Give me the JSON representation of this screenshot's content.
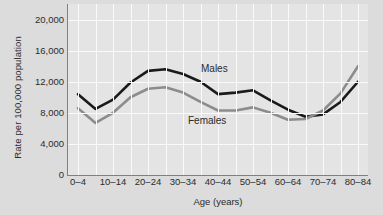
{
  "chart_data": {
    "type": "line",
    "title": "",
    "xlabel": "Age (years)",
    "ylabel": "Rate per 100,000 population",
    "xlim_categories": [
      "0–4",
      "5–9",
      "10–14",
      "15–19",
      "20–24",
      "25–29",
      "30–34",
      "35–39",
      "40–44",
      "45–49",
      "50–54",
      "55–59",
      "60–64",
      "65–69",
      "70–74",
      "75–79",
      "80–84"
    ],
    "categories": [
      "0–4",
      "5–9",
      "10–14",
      "15–19",
      "20–24",
      "25–29",
      "30–34",
      "35–39",
      "40–44",
      "45–49",
      "50–54",
      "55–59",
      "60–64",
      "65–69",
      "70–74",
      "75–79",
      "80–84"
    ],
    "xticklabels_shown": [
      "0–4",
      "10–14",
      "20–24",
      "30–34",
      "40–44",
      "50–54",
      "60–64",
      "70–74",
      "80–84"
    ],
    "yticklabels": [
      "0",
      "4,000",
      "8,000",
      "12,000",
      "16,000",
      "20,000"
    ],
    "ytickvalues": [
      0,
      4000,
      8000,
      12000,
      16000,
      20000
    ],
    "ylim": [
      0,
      22000
    ],
    "grid": true,
    "legend_position": "inline-annotations",
    "series": [
      {
        "name": "Males",
        "color": "#1a1a1a",
        "values": [
          10400,
          8500,
          9700,
          11900,
          13400,
          13600,
          13000,
          12000,
          10400,
          10600,
          10900,
          9600,
          8400,
          7500,
          7800,
          9400,
          12000
        ]
      },
      {
        "name": "Females",
        "color": "#8c8c8c",
        "values": [
          8600,
          6700,
          8000,
          10000,
          11100,
          11300,
          10600,
          9400,
          8300,
          8300,
          8700,
          8000,
          7100,
          7200,
          8300,
          10500,
          14000
        ]
      }
    ],
    "annotations": [
      {
        "text": "Males",
        "series": "Males"
      },
      {
        "text": "Females",
        "series": "Females"
      }
    ]
  },
  "colors": {
    "background": "#dcdcdc",
    "plot_background": "#e4e4e4",
    "gridline": "#fafafa",
    "axis": "#808080",
    "males_line": "#1a1a1a",
    "females_line": "#8c8c8c",
    "text": "#2b2b2b"
  }
}
